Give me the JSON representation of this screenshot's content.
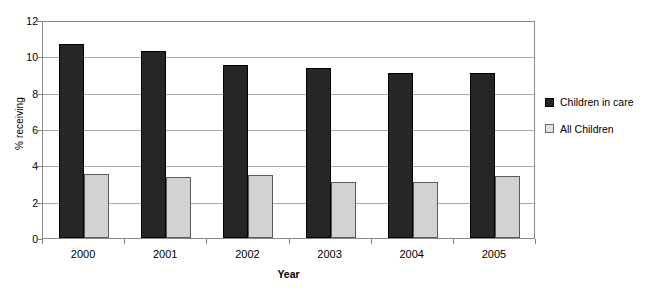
{
  "chart_data": {
    "type": "bar",
    "title": "",
    "xlabel": "Year",
    "ylabel": "% receiving",
    "categories": [
      "2000",
      "2001",
      "2002",
      "2003",
      "2004",
      "2005"
    ],
    "series": [
      {
        "name": "Children in care",
        "color": "#262626",
        "values": [
          10.7,
          10.3,
          9.5,
          9.35,
          9.1,
          9.1
        ]
      },
      {
        "name": "All Children",
        "color": "#d2d2d2",
        "values": [
          3.5,
          3.35,
          3.45,
          3.1,
          3.1,
          3.4
        ]
      }
    ],
    "ylim": [
      0,
      12
    ],
    "ytick_step": 2,
    "yticks": [
      "12",
      "10",
      "8",
      "6",
      "4",
      "2",
      "0"
    ],
    "grid": true,
    "legend_position": "right"
  }
}
